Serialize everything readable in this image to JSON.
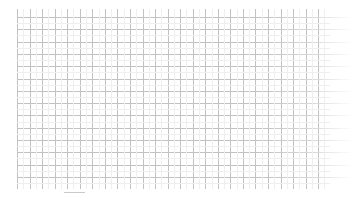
{
  "document": {
    "type": "blank-grid",
    "description": "Empty chart plot area showing only gridlines",
    "width": 362,
    "height": 197,
    "background_color": "#ffffff"
  },
  "chart_data": {
    "type": "line",
    "title": "",
    "subtitle": "",
    "xlabel": "",
    "ylabel": "",
    "categories": [],
    "x": [],
    "series": [],
    "values": [],
    "xlim": [
      0,
      24
    ],
    "ylim": [
      0,
      14
    ],
    "grid": true,
    "grid_color": "#c2c2c2",
    "grid_minor_color": "#efefef",
    "legend": false,
    "legend_position": "none",
    "tick_labels_x": [],
    "tick_labels_y": [],
    "annotations": [],
    "data_points_visible": 0,
    "note": "No data series, no axis labels, no tick labels, no legend are rendered — only the empty grid."
  },
  "grid": {
    "origin_x": 17,
    "origin_y": 9,
    "width": 309,
    "height": 178,
    "vertical_line_count": 25,
    "vertical_spacing": 12.55,
    "horizontal_line_count": 15,
    "horizontal_spacing": 12.3,
    "horizontal_overshoot_right": 27,
    "line_color": "#c2c2c2",
    "minor_line_color": "#efefef"
  },
  "marks": {
    "bottom_tick": {
      "x": 64,
      "y": 192,
      "width": 21,
      "color": "#9e9e9e"
    }
  }
}
